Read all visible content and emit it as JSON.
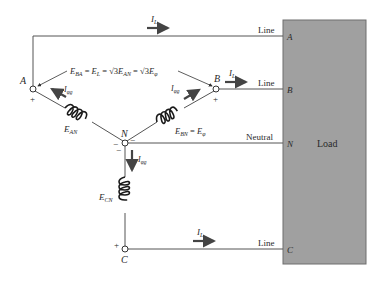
{
  "diagram": {
    "colors": {
      "load_fill": "#a0a0a0",
      "load_border": "#6e6e6e",
      "wire": "#555555",
      "arrow": "#444444"
    },
    "nodes": {
      "A": "A",
      "B": "B",
      "C": "C",
      "N": "N"
    },
    "polarity": {
      "plus": "+",
      "minus": "−"
    },
    "line_labels": {
      "line_a": "Line",
      "line_b": "Line",
      "neutral": "Neutral",
      "line_c": "Line"
    },
    "load": {
      "label": "Load",
      "terminals": [
        "A",
        "B",
        "N",
        "C"
      ]
    },
    "currents": {
      "line_current": "I",
      "line_current_sub": "L",
      "phase_current": "I",
      "phase_current_sub": "φg"
    },
    "equations": {
      "line_voltage": {
        "e_ba": "E",
        "e_ba_sub": "BA",
        "eq1": " = ",
        "e_l": "E",
        "e_l_sub": "L",
        "eq2": " = √3",
        "e_an": "E",
        "e_an_sub": "AN",
        "eq3": " = √3",
        "e_phi": "E",
        "e_phi_sub": "φ"
      },
      "phase_voltage": {
        "e_bn": "E",
        "e_bn_sub": "BN",
        "eq": " = ",
        "e_phi": "E",
        "e_phi_sub": "φ"
      }
    },
    "coil_labels": {
      "an": "E",
      "an_sub": "AN",
      "cn": "E",
      "cn_sub": "CN"
    }
  }
}
